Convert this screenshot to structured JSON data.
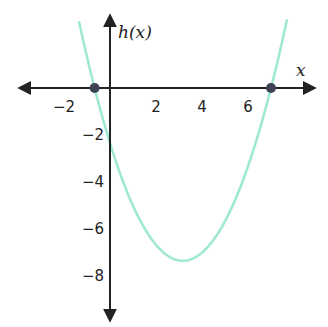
{
  "chart_data": {
    "type": "line",
    "title": "",
    "function_label": "h(x)",
    "xlabel": "x",
    "ylabel": "h(x)",
    "equation": "h(x) = 0.5(x + 2/3)(x - 7)",
    "x_ticks": [
      -2,
      2,
      4,
      6
    ],
    "x_tick_labels": [
      "−2",
      "2",
      "4",
      "6"
    ],
    "y_ticks": [
      -2,
      -4,
      -6,
      -8
    ],
    "y_tick_labels": [
      "−2",
      "−4",
      "−6",
      "−8"
    ],
    "xlim": [
      -3.9,
      8.9
    ],
    "ylim": [
      -10.2,
      3.1
    ],
    "grid": false,
    "legend": null,
    "series": [
      {
        "name": "h(x)",
        "color": "#9fe8d4",
        "x": [
          -1.35,
          -0.67,
          0,
          1,
          2,
          3,
          3.17,
          4,
          5,
          6,
          7,
          7.7
        ],
        "y": [
          3.1,
          0,
          -2.33,
          -5.0,
          -6.67,
          -7.33,
          -7.35,
          -7.0,
          -6.0,
          -3.67,
          0,
          3.1
        ]
      }
    ],
    "highlighted_points": [
      {
        "label": "left x-intercept",
        "x": -0.67,
        "y": 0
      },
      {
        "label": "right x-intercept",
        "x": 7,
        "y": 0
      }
    ],
    "vertex": {
      "x": 3.17,
      "y": -7.35
    },
    "y_intercept": -2.33
  },
  "style": {
    "axis_color": "#222222",
    "curve_color": "#9fe8d4",
    "point_color": "#3d4355"
  }
}
